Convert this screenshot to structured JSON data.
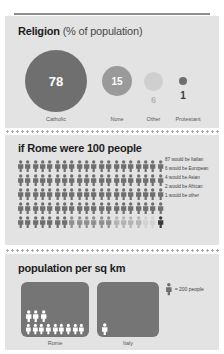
{
  "sections": {
    "religion": {
      "title_bold": "Religion",
      "title_light": "(% of population)",
      "items": [
        {
          "label": "Catholic",
          "value": "78",
          "color": "#6f6f6f"
        },
        {
          "label": "None",
          "value": "15",
          "color": "#9a9a9a"
        },
        {
          "label": "Other",
          "value": "6",
          "color": "#cfcfcf"
        },
        {
          "label": "Protestant",
          "value": "1",
          "color": "#6f6f6f"
        }
      ]
    },
    "people": {
      "title": "if Rome were 100 people",
      "total": 100,
      "legend": [
        {
          "text": "87 would be Italian",
          "count": 87,
          "color": "#6f6f6f"
        },
        {
          "text": "6 would be European",
          "count": 6,
          "color": "#8f8f8f"
        },
        {
          "text": "4 would be Asian",
          "count": 4,
          "color": "#b4b4b4"
        },
        {
          "text": "2 would be African",
          "count": 2,
          "color": "#d2d2d2"
        },
        {
          "text": "1 would be other",
          "count": 1,
          "color": "#3b3b3b"
        }
      ]
    },
    "population": {
      "title": "population per sq km",
      "legend_text": "= 200 people",
      "unit_people": 200,
      "places": [
        {
          "label": "Rome",
          "figures": 12,
          "rows": [
            3,
            9
          ]
        },
        {
          "label": "Italy",
          "figures": 1,
          "rows": [
            1
          ]
        }
      ]
    }
  },
  "chart_data": [
    {
      "type": "bar",
      "title": "Religion (% of population)",
      "categories": [
        "Catholic",
        "None",
        "Other",
        "Protestant"
      ],
      "values": [
        78,
        15,
        6,
        1
      ],
      "xlabel": "",
      "ylabel": "% of population",
      "ylim": [
        0,
        100
      ]
    },
    {
      "type": "pie",
      "title": "if Rome were 100 people",
      "categories": [
        "Italian",
        "European",
        "Asian",
        "African",
        "Other"
      ],
      "values": [
        87,
        6,
        4,
        2,
        1
      ],
      "ylim": [
        0,
        100
      ]
    },
    {
      "type": "bar",
      "title": "population per sq km",
      "categories": [
        "Rome",
        "Italy"
      ],
      "values": [
        2400,
        200
      ],
      "ylabel": "people per sq km",
      "ylim": [
        0,
        2400
      ]
    }
  ]
}
